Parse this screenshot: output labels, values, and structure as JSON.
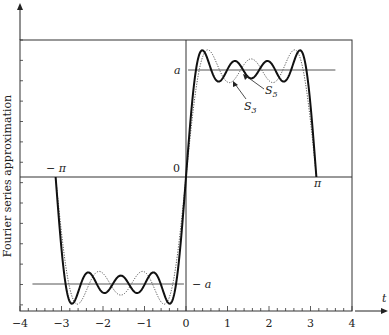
{
  "chart_data": {
    "type": "line",
    "title": "",
    "xlabel": "t",
    "ylabel": "Fourier series approximation",
    "xlim": [
      -4,
      4
    ],
    "ylim_in_units_of_a": [
      -1.25,
      1.28
    ],
    "x_ticks": [
      "-4",
      "-3",
      "-2",
      "-1",
      "0",
      "1",
      "2",
      "3",
      "4"
    ],
    "x_tick_values": [
      -4,
      -3,
      -2,
      -1,
      0,
      1,
      2,
      3,
      4
    ],
    "grid": false,
    "annotations": {
      "a_label": "a",
      "neg_a_label": "− a",
      "neg_pi_label": "− π",
      "pi_label": "π",
      "zero_label": "0",
      "s3_label": "S",
      "s3_sub": "3",
      "s5_label": "S",
      "s5_sub": "5"
    },
    "square_wave": {
      "name": "f(t)",
      "high": 1,
      "low": -1,
      "domain": [
        -3.1416,
        3.1416
      ],
      "description": "a for 0<t<π, −a for −π<t<0"
    },
    "series": [
      {
        "name": "S3",
        "style": "dotted",
        "odd_harmonics": [
          1,
          3,
          5
        ],
        "coefficient": "4a/(nπ)"
      },
      {
        "name": "S5",
        "style": "solid-bold",
        "odd_harmonics": [
          1,
          3,
          5,
          7
        ],
        "coefficient": "4a/(nπ)"
      }
    ],
    "level_lines": [
      {
        "name": "a",
        "y": 1,
        "t_range": [
          0.05,
          3.6
        ]
      },
      {
        "name": "-a",
        "y": -1,
        "t_range": [
          -3.7,
          -0.05
        ]
      }
    ]
  }
}
